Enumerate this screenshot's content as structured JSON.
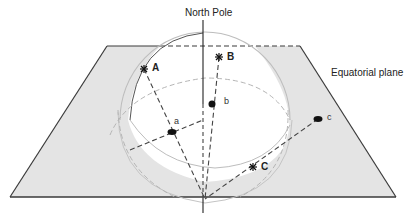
{
  "diagram": {
    "title_labels": {
      "north_pole": "North Pole",
      "equatorial_plane": "Equatorial plane"
    },
    "stars": [
      {
        "id": "A",
        "label": "A"
      },
      {
        "id": "B",
        "label": "B"
      },
      {
        "id": "C",
        "label": "C"
      }
    ],
    "projections": [
      {
        "id": "a",
        "label": "a"
      },
      {
        "id": "b",
        "label": "b"
      },
      {
        "id": "c",
        "label": "c"
      }
    ],
    "colors": {
      "plane_fill": "#e4e4e4",
      "plane_edge": "#3a3a3a",
      "sphere_edge": "#bdbdbd",
      "dashed_line": "#444444",
      "hidden_curve": "#b5b5b5",
      "marker": "#111111"
    }
  }
}
